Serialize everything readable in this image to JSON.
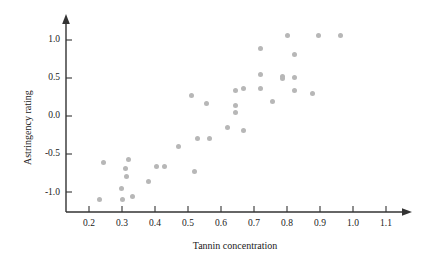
{
  "chart_data": {
    "type": "scatter",
    "title": "",
    "xlabel": "Tannin concentration",
    "ylabel": "Astringency rating",
    "xlim": [
      0.15,
      1.17
    ],
    "ylim": [
      -1.28,
      1.13
    ],
    "grid": false,
    "legend": null,
    "xticks": [
      0.2,
      0.3,
      0.4,
      0.5,
      0.6,
      0.7,
      0.8,
      0.9,
      1.0,
      1.1
    ],
    "xtick_labels": [
      "0.2",
      "0.3",
      "0.4",
      "0.5",
      "0.6",
      "0.7",
      "0.8",
      "0.9",
      "1.0",
      "1.1"
    ],
    "yticks": [
      -1.0,
      -0.5,
      0.0,
      0.5,
      1.0
    ],
    "ytick_labels": [
      "-1.0",
      "-0.5",
      "0.0",
      "0.5",
      "1.0"
    ],
    "marker_color": "#b7b7b7",
    "axis_color": "#333333",
    "points": [
      {
        "x": 0.233,
        "y": -1.085
      },
      {
        "x": 0.243,
        "y": -0.614
      },
      {
        "x": 0.3,
        "y": -1.085
      },
      {
        "x": 0.297,
        "y": -0.954
      },
      {
        "x": 0.31,
        "y": -0.68
      },
      {
        "x": 0.315,
        "y": -0.797
      },
      {
        "x": 0.32,
        "y": -0.575
      },
      {
        "x": 0.333,
        "y": -1.046
      },
      {
        "x": 0.381,
        "y": -0.85
      },
      {
        "x": 0.406,
        "y": -0.666
      },
      {
        "x": 0.43,
        "y": -0.666
      },
      {
        "x": 0.47,
        "y": -0.405
      },
      {
        "x": 0.512,
        "y": 0.274
      },
      {
        "x": 0.521,
        "y": -0.719
      },
      {
        "x": 0.529,
        "y": -0.288
      },
      {
        "x": 0.555,
        "y": 0.163
      },
      {
        "x": 0.564,
        "y": -0.288
      },
      {
        "x": 0.621,
        "y": -0.144
      },
      {
        "x": 0.645,
        "y": 0.327
      },
      {
        "x": 0.645,
        "y": 0.131
      },
      {
        "x": 0.645,
        "y": 0.052
      },
      {
        "x": 0.667,
        "y": -0.196
      },
      {
        "x": 0.667,
        "y": 0.353
      },
      {
        "x": 0.721,
        "y": 0.876
      },
      {
        "x": 0.721,
        "y": 0.549
      },
      {
        "x": 0.721,
        "y": 0.353
      },
      {
        "x": 0.755,
        "y": 0.196
      },
      {
        "x": 0.785,
        "y": 0.51
      },
      {
        "x": 0.785,
        "y": 0.484
      },
      {
        "x": 0.8,
        "y": 1.046
      },
      {
        "x": 0.824,
        "y": 0.81
      },
      {
        "x": 0.824,
        "y": 0.497
      },
      {
        "x": 0.824,
        "y": 0.327
      },
      {
        "x": 0.876,
        "y": 0.288
      },
      {
        "x": 0.894,
        "y": 1.046
      },
      {
        "x": 0.961,
        "y": 1.046
      }
    ]
  },
  "axis": {
    "x_axis_name": "x-axis",
    "y_axis_name": "y-axis",
    "arrow_x": "x-axis-arrow",
    "arrow_y": "y-axis-arrow"
  }
}
